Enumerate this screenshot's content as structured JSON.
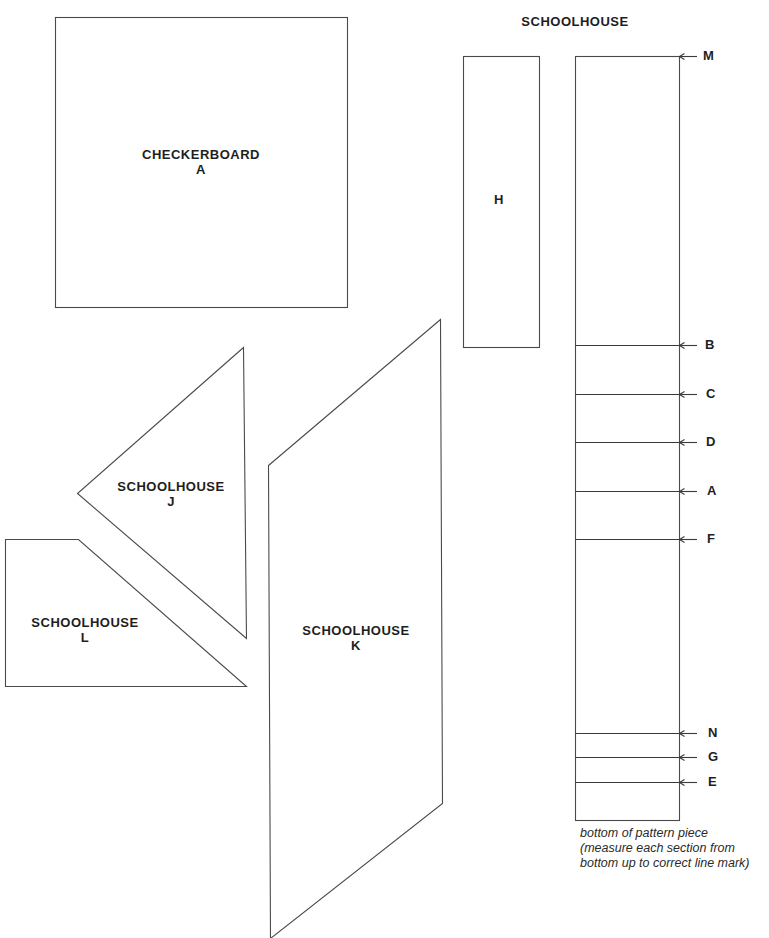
{
  "header": {
    "title": "SCHOOLHOUSE"
  },
  "pieces": {
    "checkerboard_a": {
      "name": "CHECKERBOARD",
      "letter": "A"
    },
    "schoolhouse_h": {
      "letter": "H"
    },
    "schoolhouse_j": {
      "name": "SCHOOLHOUSE",
      "letter": "J"
    },
    "schoolhouse_l": {
      "name": "SCHOOLHOUSE",
      "letter": "L"
    },
    "schoolhouse_k": {
      "name": "SCHOOLHOUSE",
      "letter": "K"
    }
  },
  "strip_marks": [
    {
      "letter": "M",
      "y": 56
    },
    {
      "letter": "B",
      "y": 345
    },
    {
      "letter": "C",
      "y": 394
    },
    {
      "letter": "D",
      "y": 442
    },
    {
      "letter": "A",
      "y": 491
    },
    {
      "letter": "F",
      "y": 539
    },
    {
      "letter": "N",
      "y": 733
    },
    {
      "letter": "G",
      "y": 757
    },
    {
      "letter": "E",
      "y": 782
    }
  ],
  "caption": {
    "line1": "bottom of pattern piece",
    "line2": "(measure each section from",
    "line3": "bottom up to correct line mark)"
  },
  "colors": {
    "line": "#4a4a4a",
    "text": "#1e1e1e",
    "background": "#ffffff"
  }
}
